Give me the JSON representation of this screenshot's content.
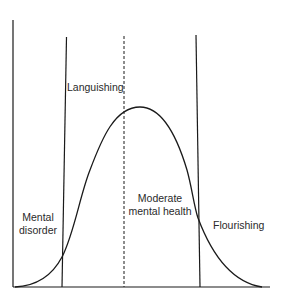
{
  "diagram": {
    "type": "mental-health-continuum",
    "labels": {
      "languishing": "Languishing",
      "mental_disorder_line1": "Mental",
      "mental_disorder_line2": "disorder",
      "moderate_line1": "Moderate",
      "moderate_line2": "mental health",
      "flourishing": "Flourishing"
    },
    "colors": {
      "line": "#1a1a1a",
      "background": "#ffffff"
    }
  }
}
